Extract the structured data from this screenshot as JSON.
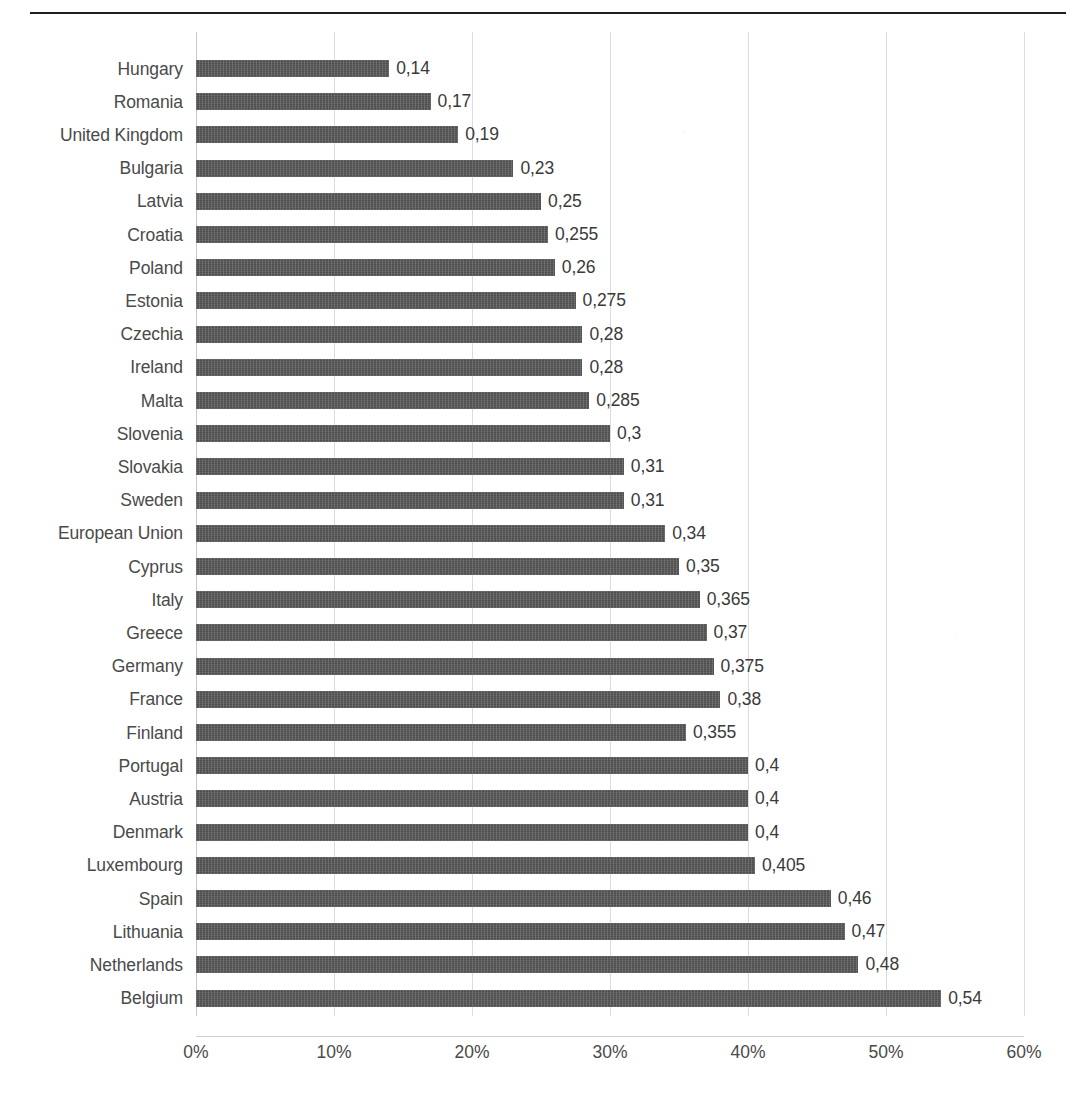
{
  "chart_data": {
    "type": "bar",
    "orientation": "horizontal",
    "title": "",
    "subtitle": "",
    "xlabel": "",
    "ylabel": "",
    "xlim": [
      0,
      0.6
    ],
    "xticks": [
      0,
      0.1,
      0.2,
      0.3,
      0.4,
      0.5,
      0.6
    ],
    "xtick_labels": [
      "0%",
      "10%",
      "20%",
      "30%",
      "40%",
      "50%",
      "60%"
    ],
    "grid": "vertical",
    "legend": "none",
    "bar_color": "#575757",
    "decimal_separator": ",",
    "categories": [
      "Hungary",
      "Romania",
      "United Kingdom",
      "Bulgaria",
      "Latvia",
      "Croatia",
      "Poland",
      "Estonia",
      "Czechia",
      "Ireland",
      "Malta",
      "Slovenia",
      "Slovakia",
      "Sweden",
      "European Union",
      "Cyprus",
      "Italy",
      "Greece",
      "Germany",
      "France",
      "Finland",
      "Portugal",
      "Austria",
      "Denmark",
      "Luxembourg",
      "Spain",
      "Lithuania",
      "Netherlands",
      "Belgium"
    ],
    "values": [
      0.14,
      0.17,
      0.19,
      0.23,
      0.25,
      0.255,
      0.26,
      0.275,
      0.28,
      0.28,
      0.285,
      0.3,
      0.31,
      0.31,
      0.34,
      0.35,
      0.365,
      0.37,
      0.375,
      0.38,
      0.355,
      0.4,
      0.4,
      0.4,
      0.405,
      0.46,
      0.47,
      0.48,
      0.54
    ],
    "value_labels": [
      "0,14",
      "0,17",
      "0,19",
      "0,23",
      "0,25",
      "0,255",
      "0,26",
      "0,275",
      "0,28",
      "0,28",
      "0,285",
      "0,3",
      "0,31",
      "0,31",
      "0,34",
      "0,35",
      "0,365",
      "0,37",
      "0,375",
      "0,38",
      "0,355",
      "0,4",
      "0,4",
      "0,4",
      "0,405",
      "0,46",
      "0,47",
      "0,48",
      "0,54"
    ]
  }
}
